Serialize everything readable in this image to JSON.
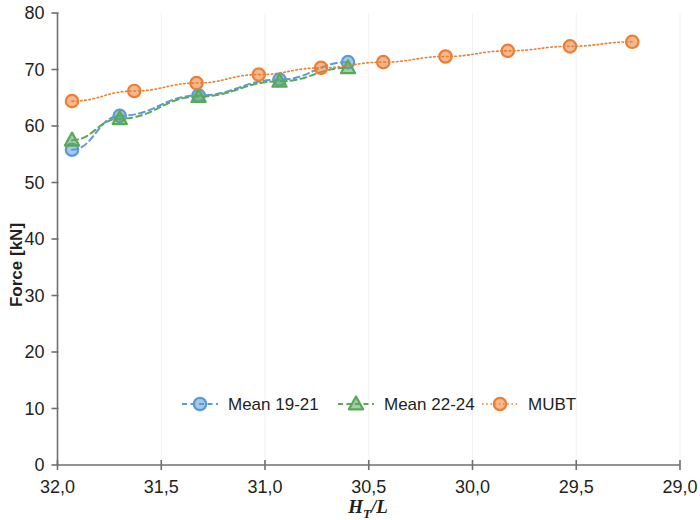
{
  "chart_data": {
    "type": "line",
    "title": "",
    "xlabel": "H_T/L",
    "xlabel_parts": {
      "base": "H",
      "sub": "T",
      "rest": "/L"
    },
    "ylabel": "Force [kN]",
    "xlim": [
      32.0,
      29.0
    ],
    "ylim": [
      0,
      80
    ],
    "x_ticks": [
      32.0,
      31.5,
      31.0,
      30.5,
      30.0,
      29.5,
      29.0
    ],
    "x_tick_labels": [
      "32,0",
      "31,5",
      "31,0",
      "30,5",
      "30,0",
      "29,5",
      "29,0"
    ],
    "y_ticks": [
      0,
      10,
      20,
      30,
      40,
      50,
      60,
      70,
      80
    ],
    "y_tick_labels": [
      "0",
      "10",
      "20",
      "30",
      "40",
      "50",
      "60",
      "70",
      "80"
    ],
    "grid": false,
    "legend_position": "bottom-center",
    "x_axis_inverted": true,
    "series": [
      {
        "name": "Mean 19-21",
        "color": "#5b9bd5",
        "marker": "circle-open",
        "line_style": "dashed",
        "x": [
          31.93,
          31.7,
          31.32,
          30.93,
          30.6
        ],
        "y": [
          55.8,
          61.8,
          65.4,
          68.2,
          71.3
        ]
      },
      {
        "name": "Mean 22-24",
        "color": "#5aa85a",
        "marker": "triangle-open",
        "line_style": "dashed",
        "x": [
          31.93,
          31.7,
          31.32,
          30.93,
          30.6
        ],
        "y": [
          57.5,
          61.3,
          65.2,
          67.9,
          70.3
        ]
      },
      {
        "name": "MUBT",
        "color": "#ed7d31",
        "marker": "circle-open",
        "line_style": "dotted",
        "x": [
          31.93,
          31.63,
          31.33,
          31.03,
          30.73,
          30.43,
          30.13,
          29.83,
          29.53,
          29.23
        ],
        "y": [
          64.4,
          66.2,
          67.6,
          69.1,
          70.3,
          71.3,
          72.3,
          73.3,
          74.1,
          74.9
        ]
      }
    ],
    "legend": [
      {
        "label": "Mean 19-21",
        "color": "#5b9bd5",
        "marker": "circle-open"
      },
      {
        "label": "Mean 22-24",
        "color": "#5aa85a",
        "marker": "triangle-open"
      },
      {
        "label": "MUBT",
        "color": "#ed7d31",
        "marker": "circle-open"
      }
    ]
  }
}
